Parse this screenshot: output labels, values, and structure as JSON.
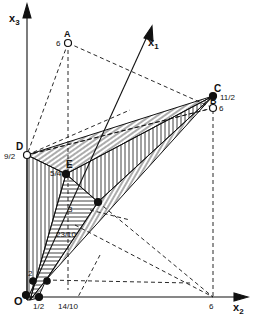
{
  "diagram": {
    "type": "3d-polyhedron-feasible-region",
    "axes": {
      "x1": "x",
      "x1_sub": "1",
      "x2": "x",
      "x2_sub": "2",
      "x3": "x",
      "x3_sub": "3"
    },
    "origin_label": "O",
    "points": {
      "A": {
        "label": "A",
        "value": "6"
      },
      "B": {
        "label": "B",
        "value": "6"
      },
      "C": {
        "label": "C",
        "value": "11/2"
      },
      "D": {
        "label": "D",
        "value": "9/2"
      },
      "E": {
        "label": "E",
        "value": "5/4"
      }
    },
    "tick_labels": {
      "x2_half": "1/2",
      "x2_14_10": "14/10",
      "x2_six": "6",
      "inner_3": "3",
      "inner_23_10": "23/10",
      "inner_2": "2"
    },
    "colors": {
      "ink": "#111111",
      "background": "#ffffff"
    }
  }
}
